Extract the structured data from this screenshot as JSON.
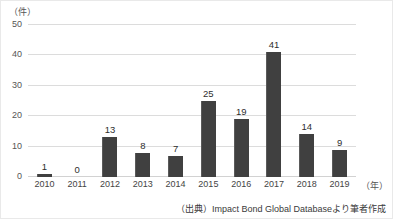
{
  "chart_data": {
    "type": "bar",
    "title": "",
    "subtitle": "",
    "xlabel": "（年）",
    "ylabel": "（件）",
    "categories": [
      "2010",
      "2011",
      "2012",
      "2013",
      "2014",
      "2015",
      "2016",
      "2017",
      "2018",
      "2019"
    ],
    "values": [
      1,
      0,
      13,
      8,
      7,
      25,
      19,
      41,
      14,
      9
    ],
    "value_labels": [
      "1",
      "0",
      "13",
      "8",
      "7",
      "25",
      "19",
      "41",
      "14",
      "9"
    ],
    "ylim": [
      0,
      50
    ],
    "ytick_values": [
      0,
      10,
      20,
      30,
      40,
      50
    ],
    "ytick_labels": [
      "0",
      "10",
      "20",
      "30",
      "40",
      "50"
    ],
    "grid": true,
    "legend": "none",
    "bar_color": "#404040",
    "gridline_color": "#dcdcdc",
    "series": [
      {
        "name": "件数",
        "values": [
          1,
          0,
          13,
          8,
          7,
          25,
          19,
          41,
          14,
          9
        ]
      }
    ],
    "annotations": {
      "source": "（出典）Impact Bond Global Databaseより筆者作成"
    }
  }
}
